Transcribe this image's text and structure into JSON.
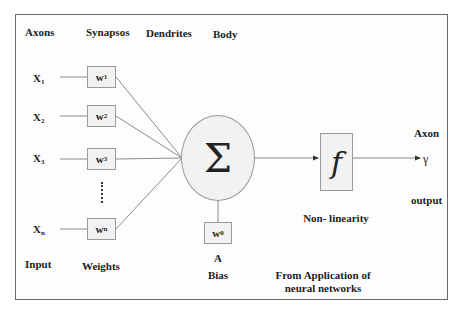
{
  "diagram": {
    "type": "artificial-neuron-model",
    "header_labels": {
      "axons": "Axons",
      "synapses": "Synapsos",
      "dendrites": "Dendrites",
      "body": "Body"
    },
    "inputs": [
      {
        "label": "X",
        "sub": "1"
      },
      {
        "label": "X",
        "sub": "2"
      },
      {
        "label": "X",
        "sub": "3"
      },
      {
        "label": "X",
        "sub": "n"
      }
    ],
    "weights": [
      {
        "label": "w",
        "sub": "1"
      },
      {
        "label": "w",
        "sub": "2"
      },
      {
        "label": "w",
        "sub": "3"
      },
      {
        "label": "w",
        "sub": "n"
      }
    ],
    "ellipsis": "......",
    "summation_symbol": "Σ",
    "bias": {
      "weight_label": "w",
      "weight_sub": "0",
      "node_label": "A",
      "caption": "Bias"
    },
    "activation": {
      "symbol": "f",
      "caption": "Non- linearity"
    },
    "output": {
      "axon_label": "Axon",
      "symbol": "γ",
      "caption": "output"
    },
    "footer_labels": {
      "input": "Input",
      "weights": "Weights"
    },
    "source": [
      "From Application of",
      "neural networks"
    ]
  }
}
